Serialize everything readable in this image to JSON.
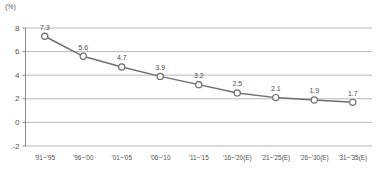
{
  "chart_data": {
    "type": "line",
    "title": "",
    "subtitle": "",
    "xlabel": "",
    "ylabel": "",
    "unit_label": "(%)",
    "categories": [
      "'91~'95",
      "'96~'00",
      "'01~'05",
      "'06~'10",
      "'11~'15",
      "'16~'20(E)",
      "'21~'25(E)",
      "'26~'30(E)",
      "'31~'35(E)"
    ],
    "values": [
      7.3,
      5.6,
      4.7,
      3.9,
      3.2,
      2.5,
      2.1,
      1.9,
      1.7
    ],
    "point_labels": [
      "7.3",
      "5.6",
      "4.7",
      "3.9",
      "3.2",
      "2.5",
      "2.1",
      "1.9",
      "1.7"
    ],
    "ylim": [
      -2,
      8
    ],
    "yticks": [
      8,
      6,
      4,
      2,
      0,
      -2
    ],
    "ytick_labels": [
      "8",
      "6",
      "4",
      "2",
      "0",
      "-2"
    ],
    "grid": true,
    "legend": false,
    "legend_position": "none",
    "series": [
      {
        "name": "",
        "values": [
          7.3,
          5.6,
          4.7,
          3.9,
          3.2,
          2.5,
          2.1,
          1.9,
          1.7
        ],
        "line_color": "#6e6e6e",
        "marker": "open-circle",
        "marker_fill": "#ffffff"
      }
    ],
    "colors": {
      "line": "#6e6e6e",
      "grid": "#9b9b9b",
      "axis": "#7d7d7d",
      "text": "#4a4a4a",
      "background": "#ffffff"
    }
  }
}
